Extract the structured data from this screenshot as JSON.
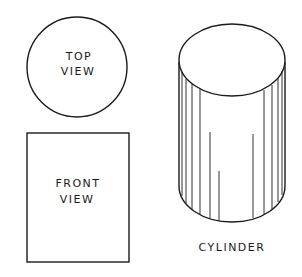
{
  "figure": {
    "top_view": {
      "line1": "TOP",
      "line2": "VIEW"
    },
    "front_view": {
      "line1": "FRONT",
      "line2": "VIEW"
    },
    "cylinder": {
      "label": "CYLINDER"
    }
  },
  "colors": {
    "stroke": "#1a1a1a",
    "background": "#ffffff"
  }
}
